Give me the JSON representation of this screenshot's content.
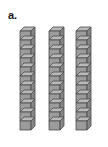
{
  "figure": {
    "label": "a.",
    "background_color": "#ffffff",
    "width": 108,
    "height": 147
  },
  "stacks": [
    {
      "id": "stack-1",
      "cube_count": 11,
      "left": 19,
      "label": "left-stack"
    },
    {
      "id": "stack-2",
      "cube_count": 11,
      "left": 48,
      "label": "middle-stack"
    },
    {
      "id": "stack-3",
      "cube_count": 11,
      "left": 75,
      "label": "right-stack"
    }
  ],
  "cube_style": {
    "top_face_color": "#b9b9b9",
    "left_face_color": "#9c9c9c",
    "right_face_color": "#868686",
    "edge_color": "#4a4a4a",
    "face_width": 11,
    "face_height": 9,
    "depth_x": 4,
    "depth_y": 4
  },
  "chart_data": {
    "type": "bar",
    "title": "a.",
    "categories": [
      "Stack 1",
      "Stack 2",
      "Stack 3"
    ],
    "values": [
      11,
      11,
      11
    ],
    "xlabel": "",
    "ylabel": "Number of cubes",
    "ylim": [
      0,
      11
    ]
  }
}
